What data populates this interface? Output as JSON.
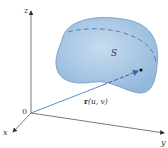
{
  "diagram": {
    "type": "parametric-surface-3d",
    "axes": {
      "x_label": "x",
      "y_label": "y",
      "z_label": "z",
      "origin_label": "0"
    },
    "surface": {
      "label": "S",
      "fill_color": "#a9c8e6",
      "edge_color": "#6e97c2",
      "dashed_curve_color": "#4f82b8"
    },
    "position_vector": {
      "label_bold": "r",
      "label_args": "(u, v)",
      "color": "#4f82b8"
    },
    "axis_color": "#555555"
  }
}
